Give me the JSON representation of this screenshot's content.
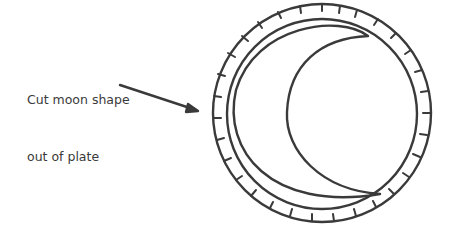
{
  "diagram": {
    "label_line1": "Cut moon shape",
    "label_line2": "out of plate",
    "stroke_color": "#3a3a3a",
    "elements": [
      "paper plate with fluted rim",
      "crescent moon outline",
      "pointer arrow"
    ]
  }
}
